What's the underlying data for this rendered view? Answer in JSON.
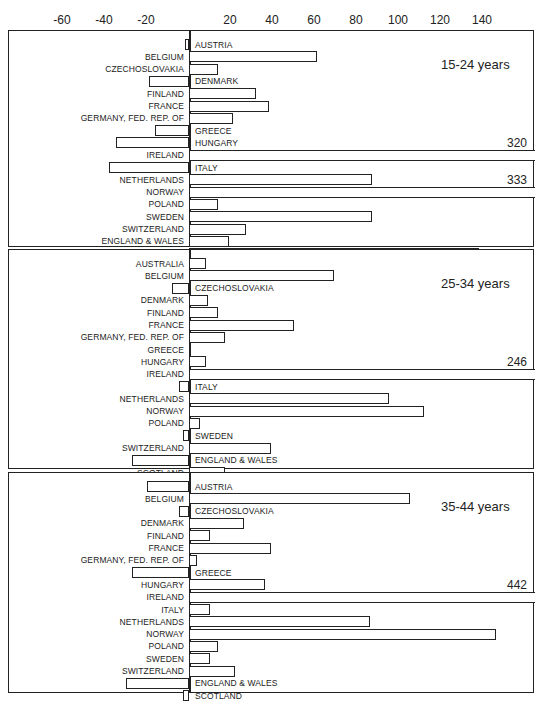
{
  "chart_data": {
    "type": "bar",
    "orientation": "horizontal",
    "title": "",
    "xlabel": "",
    "ylabel": "",
    "x_ticks": [
      -60,
      -40,
      -20,
      20,
      40,
      60,
      80,
      100,
      120,
      140
    ],
    "xlim": [
      -85,
      160
    ],
    "grid": false,
    "panels": [
      {
        "title": "15-24 years",
        "categories": [
          "AUSTRIA",
          "BELGIUM",
          "CZECHOSLOVAKIA",
          "DENMARK",
          "FINLAND",
          "FRANCE",
          "GERMANY, FED. REP. OF",
          "GREECE",
          "HUNGARY",
          "IRELAND",
          "ITALY",
          "NETHERLANDS",
          "NORWAY",
          "POLAND",
          "SWEDEN",
          "SWITZERLAND",
          "ENGLAND & WALES",
          "SCOTLAND"
        ],
        "values": [
          -2,
          61,
          14,
          -19,
          32,
          38,
          21,
          -16,
          -35,
          320,
          -38,
          87,
          333,
          14,
          87,
          27,
          19,
          138
        ],
        "overflow_labels": {
          "IRELAND": "320",
          "NORWAY": "333"
        }
      },
      {
        "title": "25-34 years",
        "categories": [
          "AUSTRALIA",
          "BELGIUM",
          "CZECHOSLOVAKIA",
          "DENMARK",
          "FINLAND",
          "FRANCE",
          "GERMANY, FED. REP. OF",
          "GREECE",
          "HUNGARY",
          "IRELAND",
          "ITALY",
          "NETHERLANDS",
          "NORWAY",
          "POLAND",
          "SWEDEN",
          "SWITZERLAND",
          "ENGLAND & WALES",
          "SCOTLAND"
        ],
        "values": [
          8,
          69,
          -8,
          9,
          14,
          50,
          17,
          0,
          8,
          246,
          -5,
          95,
          112,
          5,
          -3,
          39,
          -27,
          17
        ],
        "overflow_labels": {
          "IRELAND": "246"
        }
      },
      {
        "title": "35-44 years",
        "categories": [
          "AUSTRIA",
          "BELGIUM",
          "CZECHOSLOVAKIA",
          "DENMARK",
          "FINLAND",
          "FRANCE",
          "GERMANY, FED. REP. OF",
          "GREECE",
          "HUNGARY",
          "IRELAND",
          "ITALY",
          "NETHERLANDS",
          "NORWAY",
          "POLAND",
          "SWEDEN",
          "SWITZERLAND",
          "ENGLAND & WALES",
          "SCOTLAND"
        ],
        "values": [
          -20,
          105,
          -5,
          26,
          10,
          39,
          4,
          -27,
          36,
          442,
          10,
          86,
          146,
          14,
          10,
          22,
          -30,
          -3
        ],
        "overflow_labels": {
          "IRELAND": "442"
        }
      }
    ]
  }
}
